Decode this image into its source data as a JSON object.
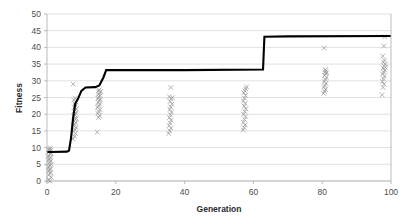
{
  "chart_data": {
    "type": "scatter",
    "title": "",
    "xlabel": "Generation",
    "ylabel": "Fitness",
    "xlim": [
      0,
      100
    ],
    "ylim": [
      0,
      50
    ],
    "xticks": [
      0,
      20,
      40,
      60,
      80,
      100
    ],
    "yticks": [
      0,
      5,
      10,
      15,
      20,
      25,
      30,
      35,
      40,
      45,
      50
    ],
    "grid": "horizontal",
    "legend": "none",
    "series": [
      {
        "name": "population-fitness",
        "type": "scatter",
        "marker": "x",
        "color": "#9a9a9a",
        "points": [
          [
            0.3,
            0.2
          ],
          [
            0.6,
            0.4
          ],
          [
            0.9,
            0.0
          ],
          [
            1.2,
            1.1
          ],
          [
            0.5,
            1.8
          ],
          [
            0.8,
            2.3
          ],
          [
            1.1,
            2.6
          ],
          [
            0.4,
            3.0
          ],
          [
            0.7,
            3.3
          ],
          [
            1.0,
            3.6
          ],
          [
            0.3,
            4.0
          ],
          [
            0.6,
            4.3
          ],
          [
            0.9,
            4.6
          ],
          [
            1.2,
            5.0
          ],
          [
            0.5,
            5.3
          ],
          [
            0.8,
            5.6
          ],
          [
            1.1,
            6.0
          ],
          [
            0.4,
            6.3
          ],
          [
            0.7,
            6.6
          ],
          [
            1.0,
            7.0
          ],
          [
            0.3,
            7.3
          ],
          [
            0.6,
            7.6
          ],
          [
            0.9,
            8.0
          ],
          [
            1.2,
            8.3
          ],
          [
            0.5,
            8.6
          ],
          [
            0.8,
            9.0
          ],
          [
            1.1,
            9.2
          ],
          [
            0.4,
            9.4
          ],
          [
            0.7,
            9.6
          ],
          [
            1.0,
            9.8
          ],
          [
            7.6,
            12.6
          ],
          [
            8.0,
            13.4
          ],
          [
            8.3,
            14.2
          ],
          [
            7.8,
            14.8
          ],
          [
            8.1,
            15.4
          ],
          [
            8.4,
            16.0
          ],
          [
            7.7,
            16.5
          ],
          [
            8.0,
            17.0
          ],
          [
            8.3,
            17.5
          ],
          [
            7.9,
            18.0
          ],
          [
            8.2,
            18.4
          ],
          [
            8.5,
            18.8
          ],
          [
            7.8,
            19.3
          ],
          [
            8.1,
            19.8
          ],
          [
            8.4,
            20.3
          ],
          [
            7.9,
            20.8
          ],
          [
            8.2,
            21.2
          ],
          [
            8.5,
            21.6
          ],
          [
            8.0,
            22.1
          ],
          [
            8.3,
            22.6
          ],
          [
            8.1,
            23.1
          ],
          [
            8.4,
            23.6
          ],
          [
            7.8,
            24.2
          ],
          [
            8.2,
            24.8
          ],
          [
            7.6,
            29.0
          ],
          [
            14.6,
            14.6
          ],
          [
            15.0,
            19.0
          ],
          [
            15.3,
            19.6
          ],
          [
            14.8,
            20.2
          ],
          [
            15.1,
            20.8
          ],
          [
            15.4,
            21.4
          ],
          [
            14.7,
            22.0
          ],
          [
            15.0,
            22.5
          ],
          [
            15.3,
            23.0
          ],
          [
            14.9,
            23.5
          ],
          [
            15.2,
            24.0
          ],
          [
            15.5,
            24.4
          ],
          [
            14.8,
            24.8
          ],
          [
            15.1,
            25.2
          ],
          [
            15.4,
            25.6
          ],
          [
            15.0,
            26.0
          ],
          [
            15.3,
            26.4
          ],
          [
            15.6,
            26.8
          ],
          [
            14.9,
            27.0
          ],
          [
            15.2,
            27.3
          ],
          [
            35.4,
            14.2
          ],
          [
            35.7,
            15.0
          ],
          [
            36.0,
            15.8
          ],
          [
            35.5,
            16.6
          ],
          [
            35.8,
            17.4
          ],
          [
            36.1,
            18.2
          ],
          [
            35.6,
            19.0
          ],
          [
            35.9,
            19.8
          ],
          [
            36.2,
            20.6
          ],
          [
            35.7,
            21.4
          ],
          [
            36.0,
            22.2
          ],
          [
            36.3,
            23.0
          ],
          [
            35.8,
            23.8
          ],
          [
            36.1,
            24.6
          ],
          [
            35.6,
            25.2
          ],
          [
            36.4,
            25.0
          ],
          [
            36.0,
            28.0
          ],
          [
            57.0,
            15.3
          ],
          [
            57.3,
            16.0
          ],
          [
            57.6,
            16.8
          ],
          [
            57.1,
            17.6
          ],
          [
            57.4,
            18.4
          ],
          [
            57.7,
            19.2
          ],
          [
            57.2,
            20.0
          ],
          [
            57.5,
            20.8
          ],
          [
            57.8,
            21.6
          ],
          [
            57.3,
            22.4
          ],
          [
            57.6,
            23.2
          ],
          [
            57.1,
            24.0
          ],
          [
            57.4,
            24.8
          ],
          [
            57.7,
            25.6
          ],
          [
            57.2,
            26.4
          ],
          [
            57.5,
            27.0
          ],
          [
            57.8,
            27.6
          ],
          [
            58.0,
            28.2
          ],
          [
            80.4,
            26.2
          ],
          [
            80.7,
            26.8
          ],
          [
            81.0,
            27.4
          ],
          [
            80.5,
            28.0
          ],
          [
            80.8,
            28.6
          ],
          [
            81.1,
            29.2
          ],
          [
            80.6,
            29.8
          ],
          [
            80.9,
            30.4
          ],
          [
            81.2,
            31.0
          ],
          [
            80.7,
            31.6
          ],
          [
            81.0,
            32.1
          ],
          [
            80.8,
            32.6
          ],
          [
            81.1,
            33.0
          ],
          [
            80.9,
            33.4
          ],
          [
            81.3,
            32.4
          ],
          [
            80.6,
            39.8
          ],
          [
            97.4,
            25.8
          ],
          [
            97.7,
            28.0
          ],
          [
            98.0,
            29.0
          ],
          [
            97.5,
            29.8
          ],
          [
            97.8,
            30.6
          ],
          [
            98.1,
            31.4
          ],
          [
            97.6,
            32.0
          ],
          [
            97.9,
            32.6
          ],
          [
            98.2,
            33.2
          ],
          [
            97.7,
            33.8
          ],
          [
            98.0,
            34.4
          ],
          [
            98.3,
            35.0
          ],
          [
            97.8,
            35.6
          ],
          [
            98.1,
            36.2
          ],
          [
            97.6,
            37.4
          ],
          [
            98.4,
            34.0
          ],
          [
            97.9,
            40.4
          ],
          [
            98.2,
            43.2
          ]
        ]
      },
      {
        "name": "best-fitness",
        "type": "line",
        "color": "#000000",
        "points": [
          [
            0.0,
            8.7
          ],
          [
            1.0,
            8.7
          ],
          [
            5.8,
            8.8
          ],
          [
            6.4,
            9.1
          ],
          [
            7.0,
            13.0
          ],
          [
            7.6,
            19.0
          ],
          [
            8.2,
            23.1
          ],
          [
            9.0,
            24.6
          ],
          [
            10.0,
            27.0
          ],
          [
            11.2,
            28.0
          ],
          [
            14.0,
            28.1
          ],
          [
            15.2,
            28.6
          ],
          [
            16.4,
            31.0
          ],
          [
            17.2,
            33.2
          ],
          [
            40.0,
            33.2
          ],
          [
            62.8,
            33.4
          ],
          [
            63.2,
            43.2
          ],
          [
            70.0,
            43.3
          ],
          [
            100.0,
            43.4
          ]
        ]
      }
    ]
  },
  "axes": {
    "y_title": "Fitness",
    "x_title": "Generation",
    "y_tick_labels": [
      "0",
      "5",
      "10",
      "15",
      "20",
      "25",
      "30",
      "35",
      "40",
      "45",
      "50"
    ],
    "x_tick_labels": [
      "0",
      "20",
      "40",
      "60",
      "80",
      "100"
    ]
  },
  "colors": {
    "marker": "#9a9a9a",
    "line": "#000000",
    "grid": "#d4d4d4",
    "axis": "#b3b3b3",
    "text": "#4d4d4d",
    "title_text": "#2b2b2b",
    "background": "#ffffff"
  }
}
